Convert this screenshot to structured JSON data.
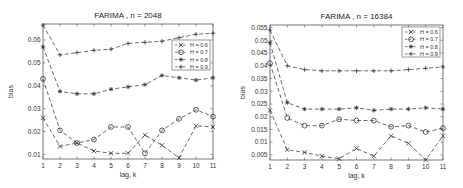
{
  "chart_data": [
    {
      "type": "line",
      "title": "FARIMA , n = 2048",
      "xlabel": "lag, k",
      "ylabel": "bias",
      "x": [
        1,
        2,
        3,
        4,
        5,
        6,
        7,
        8,
        9,
        10,
        11
      ],
      "xlim": [
        1,
        11
      ],
      "ylim": [
        0.008,
        0.067
      ],
      "yticks": [
        0.01,
        0.02,
        0.03,
        0.04,
        0.05,
        0.06
      ],
      "ytick_labels": [
        "0.01",
        "0.02",
        "0.03",
        "0.04",
        "0.05",
        "0.06"
      ],
      "grid": false,
      "legend_position": "upper right",
      "series": [
        {
          "name": "H = 0.6",
          "marker": "x",
          "values": [
            0.026,
            0.0135,
            0.015,
            0.0115,
            0.0105,
            0.0105,
            0.0185,
            0.014,
            0.0085,
            0.0225,
            0.022
          ]
        },
        {
          "name": "H = 0.7",
          "marker": "o",
          "values": [
            0.043,
            0.0205,
            0.015,
            0.0165,
            0.022,
            0.022,
            0.0105,
            0.0205,
            0.0255,
            0.0295,
            0.0265
          ]
        },
        {
          "name": "H = 0.8",
          "marker": "*",
          "values": [
            0.057,
            0.0375,
            0.0365,
            0.0365,
            0.0385,
            0.0395,
            0.0405,
            0.0445,
            0.0435,
            0.0425,
            0.0435
          ]
        },
        {
          "name": "H = 0.9",
          "marker": "+",
          "values": [
            0.0665,
            0.0535,
            0.0545,
            0.0555,
            0.056,
            0.0585,
            0.059,
            0.0595,
            0.061,
            0.0625,
            0.063
          ]
        }
      ]
    },
    {
      "type": "line",
      "title": "FARIMA , n = 16384",
      "xlabel": "lag, k",
      "ylabel": "bias",
      "x": [
        1,
        2,
        3,
        4,
        5,
        6,
        7,
        8,
        9,
        10,
        11
      ],
      "xlim": [
        1,
        11
      ],
      "ylim": [
        0.003,
        0.056
      ],
      "yticks": [
        0.005,
        0.01,
        0.015,
        0.02,
        0.025,
        0.03,
        0.035,
        0.04,
        0.045,
        0.05,
        0.055
      ],
      "ytick_labels": [
        "0.005",
        "0.01",
        "0.015",
        "0.02",
        "0.025",
        "0.03",
        "0.035",
        "0.04",
        "0.045",
        "0.05",
        "0.055"
      ],
      "grid": false,
      "legend_position": "upper right",
      "series": [
        {
          "name": "H = 0.6",
          "marker": "x",
          "values": [
            0.0225,
            0.007,
            0.006,
            0.0045,
            0.0035,
            0.0075,
            0.0045,
            0.0125,
            0.0095,
            0.003,
            0.0125
          ]
        },
        {
          "name": "H = 0.7",
          "marker": "o",
          "values": [
            0.041,
            0.0195,
            0.0165,
            0.0165,
            0.019,
            0.0185,
            0.0185,
            0.016,
            0.0165,
            0.014,
            0.0155
          ]
        },
        {
          "name": "H = 0.8",
          "marker": "*",
          "values": [
            0.049,
            0.0255,
            0.023,
            0.023,
            0.023,
            0.0235,
            0.0225,
            0.023,
            0.023,
            0.0235,
            0.023
          ]
        },
        {
          "name": "H = 0.9",
          "marker": "+",
          "values": [
            0.054,
            0.04,
            0.0385,
            0.038,
            0.038,
            0.038,
            0.038,
            0.038,
            0.0385,
            0.039,
            0.0395
          ]
        }
      ]
    }
  ],
  "left": {
    "title": "FARIMA , n = 2048",
    "xlabel": "lag, k",
    "ylabel": "bias",
    "legend": [
      "H = 0.6",
      "H = 0.7",
      "H = 0.8",
      "H = 0.9"
    ]
  },
  "right": {
    "title": "FARIMA , n = 16384",
    "xlabel": "lag, k",
    "ylabel": "bias",
    "legend": [
      "H = 0.6",
      "H = 0.7",
      "H = 0.8",
      "H = 0.9"
    ]
  }
}
